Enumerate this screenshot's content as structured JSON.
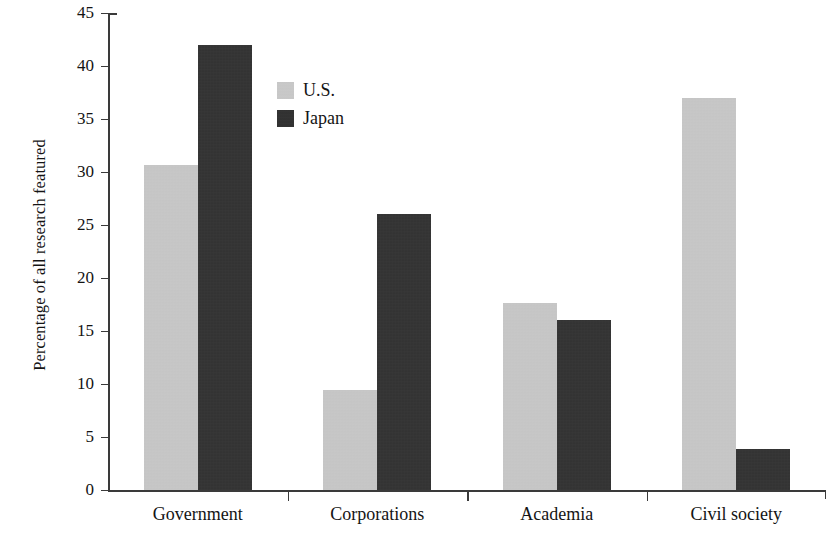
{
  "chart_data": {
    "type": "bar",
    "title": "",
    "subtitle": "",
    "xlabel": "",
    "ylabel": "Percentage of all research featured",
    "categories": [
      "Government",
      "Corporations",
      "Academia",
      "Civil society"
    ],
    "series": [
      {
        "name": "U.S.",
        "color": "#c9c9c9",
        "values": [
          30.7,
          9.4,
          17.6,
          37.0
        ]
      },
      {
        "name": "Japan",
        "color": "#2e2e2e",
        "values": [
          42.0,
          26.0,
          16.0,
          3.9
        ]
      }
    ],
    "ylim": [
      0,
      45
    ],
    "ytick_step": 5,
    "yticks": [
      "0",
      "5",
      "10",
      "15",
      "20",
      "25",
      "30",
      "35",
      "40",
      "45"
    ],
    "grid": false,
    "legend_position": "top-left-inside",
    "axis_color": "#3a3a3a",
    "background": "#ffffff"
  },
  "legend": {
    "items": [
      {
        "label": "U.S.",
        "color": "#c9c9c9"
      },
      {
        "label": "Japan",
        "color": "#2e2e2e"
      }
    ]
  }
}
